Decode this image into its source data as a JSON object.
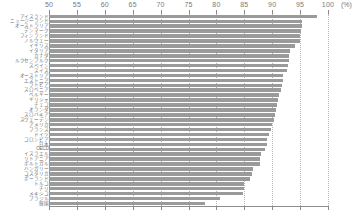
{
  "chart_data": {
    "type": "bar",
    "orientation": "horizontal",
    "title": "",
    "xlabel": "(%)",
    "ylabel": "",
    "xlim": [
      50,
      100
    ],
    "xticks": [
      50,
      55,
      60,
      65,
      70,
      75,
      80,
      85,
      90,
      95,
      100
    ],
    "xtick_labels": [
      "50",
      "55",
      "60",
      "65",
      "70",
      "75",
      "80",
      "85",
      "90",
      "95",
      "100"
    ],
    "unit_label": "(%)",
    "grid": true,
    "grid_style": "dotted",
    "legend": null,
    "bar_color": "#9a9a9a",
    "categories": [
      "アイスランド",
      "ニュージーランド",
      "オーストラリア",
      "デンマーク",
      "フィンランド",
      "ノルウェー",
      "イギリス",
      "イタリア",
      "カナダ",
      "ルクセンブルク",
      "スペイン",
      "スイス",
      "オーストリア",
      "エストニア",
      "ラトビア",
      "スロベニア",
      "ベルギー",
      "ギリシャ",
      "チェコ",
      "オランダ",
      "スロバキア",
      "スウェーデン",
      "アメリカ",
      "フランス",
      "ドイツ",
      "コロンビア",
      "日本",
      "OECD",
      "イスラエル",
      "リトアニア",
      "ポルトガル",
      "ハンガリー",
      "コスタリカ",
      "ポーランド",
      "トルコ",
      "チリ",
      "メキシコ",
      "ブラジル",
      "韓国"
    ],
    "values": [
      98.0,
      95.4,
      95.3,
      95.1,
      95.0,
      94.9,
      94.0,
      93.2,
      93.1,
      93.0,
      92.8,
      92.7,
      92.0,
      91.9,
      91.7,
      91.5,
      91.3,
      91.1,
      90.9,
      90.7,
      90.5,
      90.3,
      89.9,
      89.7,
      89.5,
      89.0,
      89.0,
      88.7,
      88.0,
      87.9,
      87.8,
      86.5,
      86.3,
      86.1,
      85.0,
      84.9,
      84.8,
      80.6,
      78.0
    ]
  }
}
